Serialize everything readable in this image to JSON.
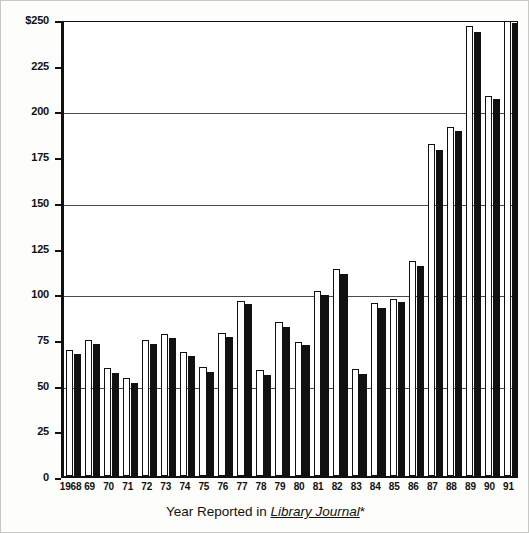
{
  "chart_data": {
    "type": "bar",
    "title": "",
    "subtitle": "",
    "xlabel_prefix": "Year Reported in ",
    "xlabel_emphasis": "Library Journal",
    "xlabel_suffix": "*",
    "xlabel_full": "Year Reported in Library Journal*",
    "ylabel": "",
    "ylim": [
      0,
      250
    ],
    "yticks": [
      0,
      25,
      50,
      75,
      100,
      125,
      150,
      175,
      200,
      225,
      250
    ],
    "ytick_labels": [
      "0",
      "25",
      "50",
      "75",
      "100",
      "125",
      "150",
      "175",
      "200",
      "225",
      "$250"
    ],
    "gridlines": [
      50,
      100,
      150,
      200,
      250
    ],
    "grid": true,
    "legend": "none",
    "legend_position": "none",
    "currency_symbol": "$",
    "categories": [
      "1968",
      "69",
      "70",
      "71",
      "72",
      "73",
      "74",
      "75",
      "76",
      "77",
      "78",
      "79",
      "80",
      "81",
      "82",
      "83",
      "84",
      "85",
      "86",
      "87",
      "88",
      "89",
      "90",
      "91"
    ],
    "series": [
      {
        "name": "white-bar",
        "style": "open",
        "color": "#ffffff",
        "edge_color": "#111111",
        "values": [
          69,
          74.5,
          59,
          53.5,
          74.5,
          77.5,
          68,
          59.5,
          78,
          96,
          58,
          84,
          73.5,
          101,
          113,
          58.5,
          94.5,
          97,
          117.5,
          181.5,
          191,
          246,
          208,
          250
        ]
      },
      {
        "name": "black-bar",
        "style": "filled",
        "color": "#111111",
        "edge_color": "#111111",
        "values": [
          67,
          72,
          56.5,
          51,
          72,
          75.5,
          65.5,
          57,
          76,
          94,
          55,
          81.5,
          71.5,
          99,
          110.5,
          56,
          92,
          95,
          115,
          178.5,
          188.5,
          243,
          206,
          248
        ]
      }
    ]
  },
  "figure": {
    "background_color": "#fdfdfb",
    "border_color": "#c9c9c4",
    "axis_color": "#111111",
    "gridline_color": "#4a4a4a"
  }
}
